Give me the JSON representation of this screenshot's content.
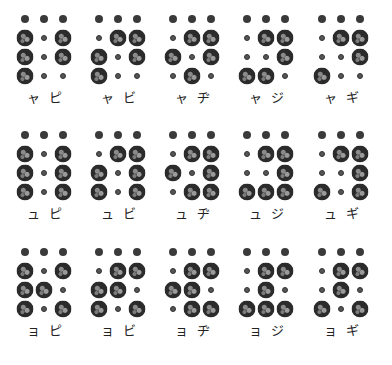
{
  "document": {
    "type": "braille-chart",
    "description": "Japanese braille youon (contracted sound) cells with katakana labels",
    "rows": [
      {
        "small_kana": "ャ",
        "cells": [
          {
            "kana": "ピ",
            "label": "ャ ピ",
            "pattern": [
              [
                1,
                0,
                1
              ],
              [
                1,
                0,
                1
              ],
              [
                1,
                0,
                0
              ]
            ]
          },
          {
            "kana": "ビ",
            "label": "ャ ビ",
            "pattern": [
              [
                0,
                1,
                1
              ],
              [
                1,
                0,
                1
              ],
              [
                1,
                0,
                0
              ]
            ]
          },
          {
            "kana": "ヂ",
            "label": "ャ ヂ",
            "pattern": [
              [
                0,
                1,
                1
              ],
              [
                1,
                0,
                1
              ],
              [
                0,
                1,
                0
              ]
            ]
          },
          {
            "kana": "ジ",
            "label": "ャ ジ",
            "pattern": [
              [
                0,
                1,
                1
              ],
              [
                0,
                0,
                1
              ],
              [
                1,
                1,
                0
              ]
            ]
          },
          {
            "kana": "ギ",
            "label": "ャ ギ",
            "pattern": [
              [
                0,
                1,
                1
              ],
              [
                0,
                0,
                1
              ],
              [
                1,
                0,
                0
              ]
            ]
          }
        ]
      },
      {
        "small_kana": "ュ",
        "cells": [
          {
            "kana": "ピ",
            "label": "ュ ピ",
            "pattern": [
              [
                1,
                0,
                1
              ],
              [
                1,
                0,
                1
              ],
              [
                1,
                0,
                1
              ]
            ]
          },
          {
            "kana": "ビ",
            "label": "ュ ビ",
            "pattern": [
              [
                0,
                1,
                1
              ],
              [
                1,
                0,
                1
              ],
              [
                1,
                0,
                1
              ]
            ]
          },
          {
            "kana": "ヂ",
            "label": "ュ ヂ",
            "pattern": [
              [
                0,
                1,
                1
              ],
              [
                1,
                0,
                1
              ],
              [
                0,
                1,
                1
              ]
            ]
          },
          {
            "kana": "ジ",
            "label": "ュ ジ",
            "pattern": [
              [
                0,
                1,
                1
              ],
              [
                0,
                0,
                1
              ],
              [
                1,
                1,
                1
              ]
            ]
          },
          {
            "kana": "ギ",
            "label": "ュ ギ",
            "pattern": [
              [
                0,
                1,
                1
              ],
              [
                0,
                0,
                1
              ],
              [
                1,
                0,
                1
              ]
            ]
          }
        ]
      },
      {
        "small_kana": "ョ",
        "cells": [
          {
            "kana": "ピ",
            "label": "ョ ピ",
            "pattern": [
              [
                1,
                0,
                1
              ],
              [
                1,
                1,
                0
              ],
              [
                1,
                0,
                1
              ]
            ]
          },
          {
            "kana": "ビ",
            "label": "ョ ビ",
            "pattern": [
              [
                0,
                1,
                1
              ],
              [
                1,
                1,
                0
              ],
              [
                1,
                0,
                1
              ]
            ]
          },
          {
            "kana": "ヂ",
            "label": "ョ ヂ",
            "pattern": [
              [
                0,
                1,
                1
              ],
              [
                1,
                1,
                0
              ],
              [
                0,
                1,
                1
              ]
            ]
          },
          {
            "kana": "ジ",
            "label": "ョ ジ",
            "pattern": [
              [
                0,
                1,
                1
              ],
              [
                0,
                1,
                0
              ],
              [
                1,
                1,
                1
              ]
            ]
          },
          {
            "kana": "ギ",
            "label": "ョ ギ",
            "pattern": [
              [
                0,
                1,
                1
              ],
              [
                0,
                1,
                0
              ],
              [
                1,
                0,
                1
              ]
            ]
          }
        ]
      }
    ]
  },
  "colors": {
    "background": "#ffffff",
    "dot": "#2b2b2b",
    "text": "#222222"
  }
}
